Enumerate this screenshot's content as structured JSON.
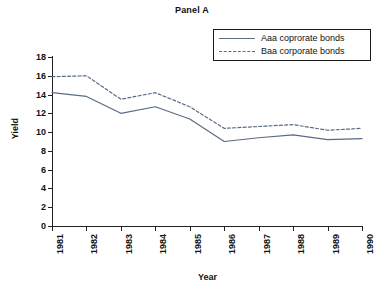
{
  "chart_data": {
    "type": "line",
    "title": "Panel A",
    "xlabel": "Year",
    "ylabel": "Yield",
    "categories": [
      "1981",
      "1982",
      "1983",
      "1984",
      "1985",
      "1986",
      "1987",
      "1988",
      "1989",
      "1990"
    ],
    "x": [
      1981,
      1982,
      1983,
      1984,
      1985,
      1986,
      1987,
      1988,
      1989,
      1990
    ],
    "series": [
      {
        "name": "Aaa coprorate bonds",
        "style": "solid",
        "color": "#5a6b85",
        "values": [
          14.2,
          13.8,
          12.0,
          12.7,
          11.4,
          9.0,
          9.4,
          9.7,
          9.2,
          9.3
        ]
      },
      {
        "name": "Baa corporate bonds",
        "style": "dashed",
        "color": "#5a6b85",
        "values": [
          15.9,
          16.0,
          13.5,
          14.2,
          12.7,
          10.4,
          10.6,
          10.8,
          10.2,
          10.4
        ]
      }
    ],
    "ylim": [
      0,
      18
    ],
    "yticks": [
      0,
      2,
      4,
      6,
      8,
      10,
      12,
      14,
      16,
      18
    ],
    "ytick_labels": [
      "0",
      "2",
      "4",
      "6",
      "8",
      "10",
      "12",
      "14",
      "16",
      "18"
    ],
    "grid": false,
    "legend_position": "top-right"
  },
  "legend": {
    "entries": [
      {
        "label": "Aaa coprorate bonds"
      },
      {
        "label": "Baa corporate bonds"
      }
    ]
  }
}
